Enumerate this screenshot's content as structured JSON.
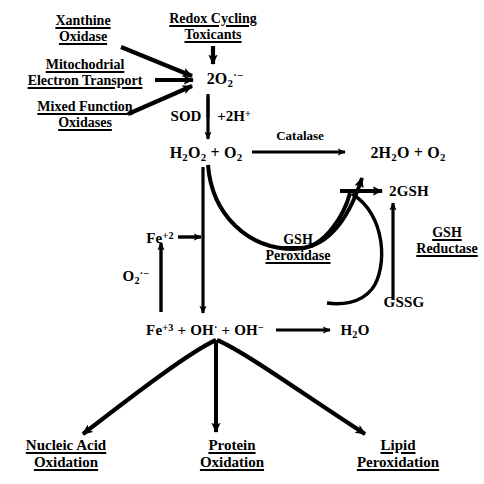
{
  "figure": {
    "type": "biochemical-pathway-diagram",
    "background_color": "#ffffff",
    "stroke_color": "#000000"
  },
  "sources": {
    "xanthine_oxidase": {
      "line1": "Xanthine",
      "line2": "Oxidase"
    },
    "mitochondrial_electron_transport": {
      "line1": "Mitochodrial",
      "line2": "Electron Transport"
    },
    "mixed_function_oxidases": {
      "line1": "Mixed Function",
      "line2": "Oxidases"
    },
    "redox_cycling_toxicants": {
      "line1": "Redox Cycling",
      "line2": "Toxicants"
    }
  },
  "species": {
    "superoxide_hub": {
      "prefix": "2O",
      "sub": "2",
      "sup": "·−"
    },
    "sod_label": "SOD",
    "sod_protons": {
      "prefix": "+2H",
      "sup": "+"
    },
    "hydrogen_peroxide": {
      "a": "H",
      "a_sub": "2",
      "b": "O",
      "b_sub": "2",
      "plus": " + ",
      "c": "O",
      "c_sub": "2"
    },
    "water_oxygen": {
      "a": "2H",
      "a_sub": "2",
      "b": "O",
      "plus": " + ",
      "c": "O",
      "c_sub": "2"
    },
    "two_gsh": "2GSH",
    "gssg": "GSSG",
    "ferrous": {
      "prefix": "Fe",
      "sup": "+2"
    },
    "superoxide_left": {
      "prefix": "O",
      "sub": "2",
      "sup": "·−"
    },
    "fenton_products": {
      "fe": "Fe",
      "fe_sup": "+3",
      "p1": " + OH",
      "p1_sup": "·",
      "p2": " + OH",
      "p2_sup": "−"
    },
    "water": {
      "a": "H",
      "a_sub": "2",
      "b": "O"
    }
  },
  "enzymes": {
    "catalase": {
      "label": "Catalase",
      "underlined": false
    },
    "gsh_peroxidase": {
      "line1": "GSH",
      "line2": "Peroxidase",
      "underlined": true
    },
    "gsh_reductase": {
      "line1": "GSH",
      "line2": "Reductase",
      "underlined": true
    }
  },
  "outcomes": {
    "nucleic_acid": {
      "line1": "Nucleic Acid",
      "line2": "Oxidation"
    },
    "protein": {
      "line1": "Protein",
      "line2": "Oxidation"
    },
    "lipid": {
      "line1": "Lipid",
      "line2": "Peroxidation"
    }
  }
}
